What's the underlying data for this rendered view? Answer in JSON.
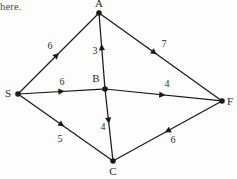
{
  "figure": {
    "kind": "directed-weighted-graph",
    "background_color": "#fdfdfc",
    "stroke_color": "#1a1a1a",
    "text_color": "#2a2a2a",
    "width": 237,
    "height": 179
  },
  "scan_text": {
    "top_left_fragment": "here."
  },
  "chart_data": {
    "type": "diagram",
    "graph_type": "directed weighted graph",
    "title": "",
    "nodes": [
      {
        "id": "A",
        "label": "A",
        "x": 99,
        "y": 13,
        "label_x": 99,
        "label_y": 4
      },
      {
        "id": "S",
        "label": "S",
        "x": 18,
        "y": 94,
        "label_x": 8,
        "label_y": 94
      },
      {
        "id": "B",
        "label": "B",
        "x": 105,
        "y": 89,
        "label_x": 96,
        "label_y": 79
      },
      {
        "id": "C",
        "label": "C",
        "x": 113,
        "y": 161,
        "label_x": 113,
        "label_y": 172
      },
      {
        "id": "F",
        "label": "F",
        "x": 222,
        "y": 101,
        "label_x": 230,
        "label_y": 102
      }
    ],
    "edges": [
      {
        "from": "S",
        "to": "A",
        "weight": "6",
        "label_x": 50,
        "label_y": 46,
        "arrow_t": 0.48
      },
      {
        "from": "A",
        "to": "F",
        "weight": "7",
        "label_x": 164,
        "label_y": 44,
        "arrow_t": 0.45
      },
      {
        "from": "B",
        "to": "A",
        "weight": "3",
        "label_x": 95,
        "label_y": 51,
        "arrow_t": 0.55
      },
      {
        "from": "S",
        "to": "B",
        "weight": "6",
        "label_x": 62,
        "label_y": 82,
        "arrow_t": 0.5
      },
      {
        "from": "B",
        "to": "F",
        "weight": "4",
        "label_x": 167,
        "label_y": 84,
        "arrow_t": 0.49
      },
      {
        "from": "B",
        "to": "C",
        "weight": "4",
        "label_x": 103,
        "label_y": 127,
        "arrow_t": 0.44
      },
      {
        "from": "S",
        "to": "C",
        "weight": "5",
        "label_x": 60,
        "label_y": 139,
        "arrow_t": 0.46
      },
      {
        "from": "F",
        "to": "C",
        "weight": "6",
        "label_x": 173,
        "label_y": 140,
        "arrow_t": 0.5
      }
    ]
  }
}
